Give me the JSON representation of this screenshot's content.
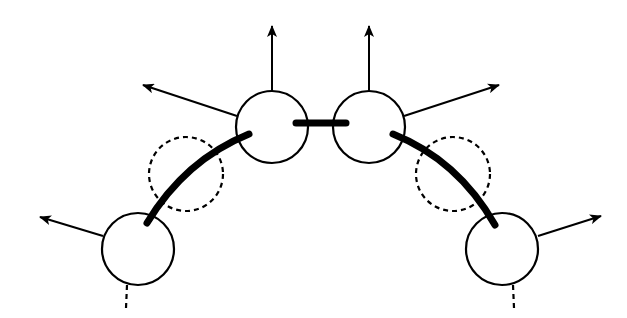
{
  "diagram": {
    "colors": {
      "stroke": "#000000",
      "background": "#ffffff"
    },
    "nodes": [
      {
        "id": "bottom-left",
        "cx": 138,
        "cy": 249,
        "r": 36
      },
      {
        "id": "top-left",
        "cx": 272,
        "cy": 127,
        "r": 36
      },
      {
        "id": "top-right",
        "cx": 369,
        "cy": 127,
        "r": 36
      },
      {
        "id": "bottom-right",
        "cx": 502,
        "cy": 249,
        "r": 36
      }
    ],
    "dashed_circles": [
      {
        "id": "left-virtual",
        "cx": 186,
        "cy": 174,
        "r": 37
      },
      {
        "id": "right-virtual",
        "cx": 453,
        "cy": 174,
        "r": 37
      }
    ],
    "bonds": [
      {
        "id": "left-arc",
        "from": "bottom-left",
        "to": "top-left"
      },
      {
        "id": "center-bar",
        "from": "top-left",
        "to": "top-right"
      },
      {
        "id": "right-arc",
        "from": "top-right",
        "to": "bottom-right"
      }
    ],
    "arrows": [
      {
        "id": "bottom-left-out",
        "x1": 103,
        "y1": 236,
        "x2": 40,
        "y2": 217
      },
      {
        "id": "top-left-out",
        "x1": 237,
        "y1": 116,
        "x2": 143,
        "y2": 85
      },
      {
        "id": "top-left-up",
        "x1": 272,
        "y1": 91,
        "x2": 272,
        "y2": 26
      },
      {
        "id": "top-right-up",
        "x1": 369,
        "y1": 91,
        "x2": 369,
        "y2": 26
      },
      {
        "id": "top-right-out",
        "x1": 404,
        "y1": 116,
        "x2": 499,
        "y2": 85
      },
      {
        "id": "bottom-right-out",
        "x1": 538,
        "y1": 236,
        "x2": 601,
        "y2": 216
      }
    ],
    "dashed_tails": [
      {
        "id": "bottom-left-tail",
        "x": 127,
        "y1": 285,
        "y2": 308
      },
      {
        "id": "bottom-right-tail",
        "x": 513,
        "y1": 285,
        "y2": 308
      }
    ]
  }
}
